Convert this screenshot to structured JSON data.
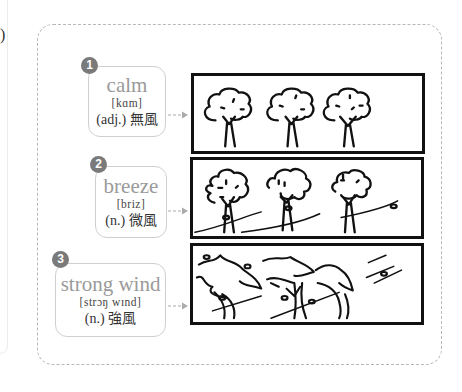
{
  "left_panel": {
    "fragment_text": ")"
  },
  "diagram": {
    "items": [
      {
        "number": "1",
        "word": "calm",
        "ipa": "[kɑm]",
        "definition": "(adj.) 無風",
        "illustration": "three-still-trees"
      },
      {
        "number": "2",
        "word": "breeze",
        "ipa": "[briz]",
        "definition": "(n.) 微風",
        "illustration": "three-trees-light-wind"
      },
      {
        "number": "3",
        "word": "strong wind",
        "ipa": "[strɔŋ wɪnd]",
        "definition": "(n.) 強風",
        "illustration": "three-trees-bending-strong-wind"
      }
    ],
    "colors": {
      "badge": "#7a7a7a",
      "word": "#9a9a9a",
      "card_border": "#cfcfcf",
      "container_dash": "#b8b8b8",
      "frame_border": "#111111"
    }
  }
}
